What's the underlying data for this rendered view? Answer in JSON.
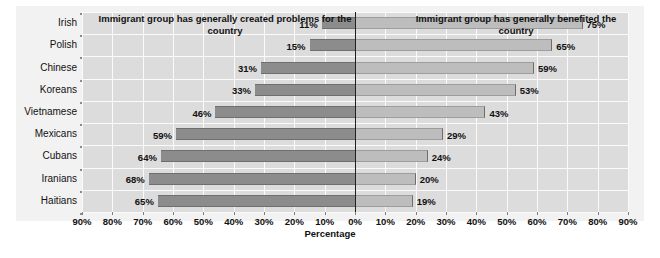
{
  "chart_data": {
    "type": "bar",
    "title": "",
    "subtitle": "",
    "orientation": "horizontal-diverging",
    "xlabel": "Percentage",
    "ylabel": "",
    "xlim": [
      -90,
      90
    ],
    "grid": true,
    "legend_position": "none",
    "panel_titles": {
      "left": "Immigrant group has generally created problems for the country",
      "right": "Immigrant group has generally benefited the country"
    },
    "categories": [
      "Irish",
      "Polish",
      "Chinese",
      "Koreans",
      "Vietnamese",
      "Mexicans",
      "Cubans",
      "Iranians",
      "Haitians"
    ],
    "series": [
      {
        "name": "Immigrant group has generally created problems for the country",
        "side": "left",
        "color": "#8c8c8c",
        "values": [
          11,
          15,
          31,
          33,
          46,
          59,
          64,
          68,
          65
        ],
        "labels": [
          "11%",
          "15%",
          "31%",
          "33%",
          "46%",
          "59%",
          "64%",
          "68%",
          "65%"
        ]
      },
      {
        "name": "Immigrant group has generally benefited the country",
        "side": "right",
        "color": "#bdbdbd",
        "values": [
          75,
          65,
          59,
          53,
          43,
          29,
          24,
          20,
          19
        ],
        "labels": [
          "75%",
          "65%",
          "59%",
          "53%",
          "43%",
          "29%",
          "24%",
          "20%",
          "19%"
        ]
      }
    ],
    "xticks": [
      -90,
      -80,
      -70,
      -60,
      -50,
      -40,
      -30,
      -20,
      -10,
      0,
      10,
      20,
      30,
      40,
      50,
      60,
      70,
      80,
      90
    ],
    "xtick_labels": [
      "90%",
      "80%",
      "70%",
      "60%",
      "50%",
      "40%",
      "30%",
      "20%",
      "10%",
      "0%",
      "10%",
      "20%",
      "30%",
      "40%",
      "50%",
      "60%",
      "70%",
      "80%",
      "90%"
    ]
  },
  "colors": {
    "figure_background": "#ffffff",
    "frame_background": "#f2f2f2",
    "plot_background": "#dcdcdc",
    "gridline": "#fbfbfb",
    "zero_line": "#231f20",
    "bar_negative": "#8c8c8c",
    "bar_positive": "#bdbdbd",
    "text": "#111111"
  },
  "caption": ""
}
